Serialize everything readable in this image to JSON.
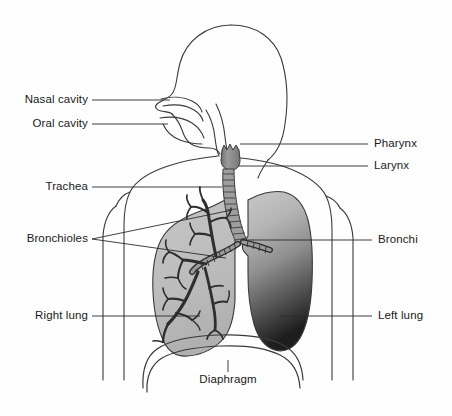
{
  "figure": {
    "background_color": "#fefefe",
    "line_color": "#3a3a3a",
    "leader_color": "#2b2b2b",
    "right_lung_fill": "#b9b9b9",
    "left_lung_fill_top": "#c4c4c4",
    "left_lung_fill_bottom": "#232323",
    "larynx_fill": "#8f8f8f",
    "trachea_fill": "#9a9a9a",
    "bronchial_tree_color": "#2e2e2e"
  },
  "labels": {
    "nasal_cavity": "Nasal cavity",
    "oral_cavity": "Oral cavity",
    "trachea": "Trachea",
    "bronchioles": "Bronchioles",
    "right_lung": "Right lung",
    "pharynx": "Pharynx",
    "larynx": "Larynx",
    "bronchi": "Bronchi",
    "left_lung": "Left lung",
    "diaphragm": "Diaphragm"
  }
}
